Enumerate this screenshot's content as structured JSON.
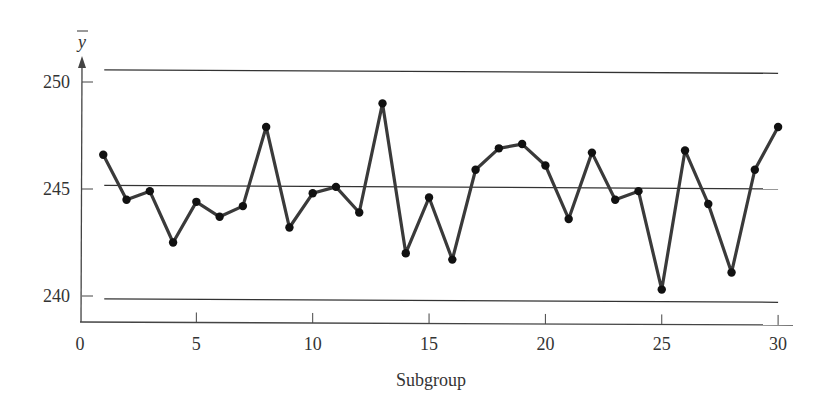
{
  "chart_data": {
    "type": "line",
    "title": "",
    "xlabel": "Subgroup",
    "ylabel": "y-bar",
    "ylabel_display": "y",
    "xlim": [
      0,
      30
    ],
    "ylim": [
      238.9,
      251.5
    ],
    "xticks": [
      0,
      5,
      10,
      15,
      20,
      25,
      30
    ],
    "yticks": [
      240,
      245,
      250
    ],
    "grid": false,
    "legend": null,
    "x": [
      1,
      2,
      3,
      4,
      5,
      6,
      7,
      8,
      9,
      10,
      11,
      12,
      13,
      14,
      15,
      16,
      17,
      18,
      19,
      20,
      21,
      22,
      23,
      24,
      25,
      26,
      27,
      28,
      29,
      30
    ],
    "series": [
      {
        "name": "Subgroup mean",
        "values": [
          246.6,
          244.5,
          244.9,
          242.5,
          244.4,
          243.7,
          244.2,
          247.9,
          243.2,
          244.8,
          245.1,
          243.9,
          249.0,
          242.0,
          244.6,
          241.7,
          245.9,
          246.9,
          247.1,
          246.1,
          243.6,
          246.7,
          244.5,
          244.9,
          240.3,
          246.8,
          244.3,
          241.1,
          245.9,
          247.9
        ]
      }
    ],
    "control_limits": {
      "ucl": 250.5,
      "center_line": 245.1,
      "lcl": 239.8,
      "x_start": 1,
      "x_end": 30
    }
  },
  "colors": {
    "line": "#3a3a3a",
    "marker": "#111111",
    "axis": "#444444",
    "limit_line": "#333333",
    "text": "#333333"
  }
}
